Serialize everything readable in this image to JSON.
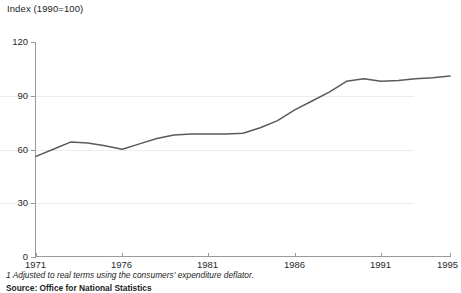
{
  "chart_data": {
    "type": "line",
    "title": "Index (1990=100)",
    "xlabel": "",
    "ylabel": "Index (1990=100)",
    "xlim": [
      1971,
      1995
    ],
    "ylim": [
      0,
      120
    ],
    "yticks": [
      0,
      30,
      60,
      90,
      120
    ],
    "xticks": [
      1971,
      1976,
      1981,
      1986,
      1991,
      1995
    ],
    "grid": true,
    "legend": "none",
    "line_color": "#5a5a5a",
    "series": [
      {
        "name": "Index (1990=100)",
        "x": [
          1971,
          1972,
          1973,
          1974,
          1975,
          1976,
          1977,
          1978,
          1979,
          1980,
          1981,
          1982,
          1983,
          1984,
          1985,
          1986,
          1987,
          1988,
          1989,
          1990,
          1991,
          1992,
          1993,
          1994,
          1995
        ],
        "values": [
          56,
          60,
          64,
          63.5,
          62,
          60,
          63,
          66,
          68,
          68.5,
          68.5,
          68.5,
          69,
          72,
          76,
          82,
          87,
          92,
          98,
          99.5,
          98,
          98.5,
          99.5,
          100,
          101
        ]
      }
    ]
  },
  "axis": {
    "y_labels": [
      "120",
      "90",
      "60",
      "30",
      "0"
    ],
    "x_labels": [
      "1971",
      "1976",
      "1981",
      "1986",
      "1991",
      "1995"
    ]
  },
  "notes": {
    "footnote": "1 Adjusted to real terms using the consumers' expenditure deflator.",
    "source": "Source: Office for National Statistics"
  }
}
